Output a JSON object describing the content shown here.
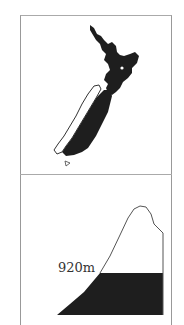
{
  "diagram": {
    "top_panel": {
      "subject": "New Zealand map",
      "fill_color": "#1e1e1e",
      "highlight_region": "outlined West Coast strip (white)"
    },
    "bottom_panel": {
      "subject": "Mountain profile",
      "elevation_label": "920m",
      "fill_color": "#1e1e1e"
    }
  }
}
